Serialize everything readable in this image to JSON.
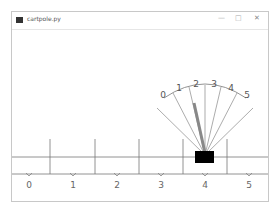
{
  "window": {
    "title": "cartpole.py",
    "minimize": "—",
    "maximize": "□",
    "close": "✕"
  },
  "scene": {
    "arc_labels": [
      "0",
      "1",
      "2",
      "3",
      "4",
      "5"
    ],
    "position_labels": [
      "0",
      "1",
      "2",
      "3",
      "4",
      "5"
    ],
    "cart_color": "#000000",
    "pole_color": "#888888"
  }
}
